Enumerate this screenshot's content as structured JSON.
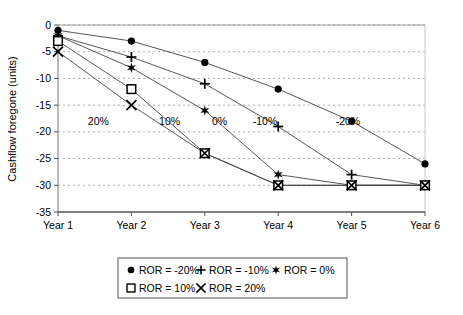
{
  "chart_data": {
    "type": "line",
    "title": "",
    "subtitle": "",
    "xlabel": "",
    "ylabel": "Cashflow foregone (units)",
    "categories": [
      "Year 1",
      "Year 2",
      "Year 3",
      "Year 4",
      "Year 5",
      "Year 6"
    ],
    "x_tick_labels": [
      "Year 1",
      "Year 2",
      "Year 3",
      "Year 4",
      "Year 5",
      "Year 6"
    ],
    "y_tick_labels": [
      "0",
      "-5",
      "-10",
      "-15",
      "-20",
      "-25",
      "-30",
      "-35"
    ],
    "y_ticks": [
      0,
      -5,
      -10,
      -15,
      -20,
      -25,
      -30,
      -35
    ],
    "ylim": [
      -35,
      0
    ],
    "grid": true,
    "grid_style": "dashed-horizontal",
    "legend_position": "bottom-center",
    "series": [
      {
        "name": "ROR = -20%",
        "marker": "filled-circle",
        "values": [
          -1,
          -3,
          -7,
          -12,
          -18,
          -26
        ]
      },
      {
        "name": "ROR = -10%",
        "marker": "plus",
        "values": [
          -2,
          -6,
          -11,
          -19,
          -28,
          -30
        ]
      },
      {
        "name": "ROR = 0%",
        "marker": "star",
        "values": [
          -2,
          -8,
          -16,
          -28,
          -30,
          -30
        ]
      },
      {
        "name": "ROR = 10%",
        "marker": "open-square",
        "values": [
          -3,
          -12,
          -24,
          -30,
          -30,
          -30
        ]
      },
      {
        "name": "ROR = 20%",
        "marker": "cross-x",
        "values": [
          -5,
          -15,
          -24,
          -30,
          -30,
          -30
        ]
      }
    ],
    "annotations": [
      {
        "text": "20%",
        "x_value": 1.55,
        "y_value": -18
      },
      {
        "text": "10%",
        "x_value": 2.52,
        "y_value": -18
      },
      {
        "text": "0%",
        "x_value": 3.2,
        "y_value": -18
      },
      {
        "text": "-10%",
        "x_value": 3.82,
        "y_value": -18
      },
      {
        "text": "-20%",
        "x_value": 4.95,
        "y_value": -18
      }
    ],
    "legend_entries": [
      {
        "label": "ROR = -20%",
        "marker": "filled-circle"
      },
      {
        "label": "ROR = -10%",
        "marker": "plus"
      },
      {
        "label": "ROR = 0%",
        "marker": "star"
      },
      {
        "label": "ROR = 10%",
        "marker": "open-square"
      },
      {
        "label": "ROR = 20%",
        "marker": "cross-x"
      }
    ],
    "colors": {
      "line": "#444444",
      "marker": "#000000",
      "grid": "#999999",
      "axis": "#555555",
      "background": "#ffffff"
    }
  }
}
